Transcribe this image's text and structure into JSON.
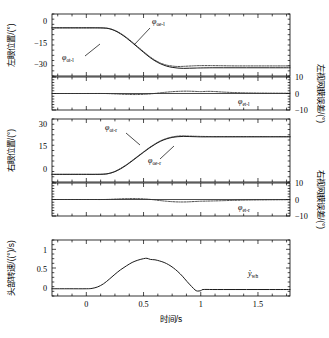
{
  "figure": {
    "xlabel": "时间/s",
    "x_ticklabels": [
      "0",
      "0.5",
      "1",
      "1.5"
    ],
    "x_tickvalues": [
      0,
      0.5,
      1,
      1.5
    ],
    "xlim": [
      -0.3,
      1.78
    ]
  },
  "panels": {
    "left_eye_position": {
      "ylabel": "左眼位置/(°)",
      "yticklabels": [
        "0",
        "-15",
        "-30"
      ],
      "ytickvalues": [
        0,
        -15,
        -30
      ],
      "ylim": [
        -38,
        5
      ],
      "annotations": [
        {
          "name": "phi-oe-l",
          "symbol": "φ",
          "subscript": "oe-l"
        },
        {
          "name": "phi-ot-l",
          "symbol": "φ",
          "subscript": "ot-l"
        }
      ]
    },
    "left_retinal_error": {
      "ylabel": "左视网膜误差/(°)",
      "yticklabels": [
        "10",
        "0",
        "-10"
      ],
      "ytickvalues": [
        10,
        0,
        -10
      ],
      "ylim": [
        -10,
        10
      ],
      "annotations": [
        {
          "name": "phi-et-l",
          "symbol": "φ",
          "subscript": "et-l"
        }
      ]
    },
    "right_eye_position": {
      "ylabel": "右眼位置/(°)",
      "yticklabels": [
        "30",
        "15",
        "0"
      ],
      "ytickvalues": [
        30,
        15,
        0
      ],
      "ylim": [
        -9,
        33
      ],
      "annotations": [
        {
          "name": "phi-ot-r",
          "symbol": "φ",
          "subscript": "ot-r"
        },
        {
          "name": "phi-oe-r",
          "symbol": "φ",
          "subscript": "oe-r"
        }
      ]
    },
    "right_retinal_error": {
      "ylabel": "右视网膜误差/(°)",
      "yticklabels": [
        "10",
        "0",
        "-10"
      ],
      "ytickvalues": [
        10,
        0,
        -10
      ],
      "ylim": [
        -10,
        10
      ],
      "annotations": [
        {
          "name": "phi-et-r",
          "symbol": "φ",
          "subscript": "et-r"
        }
      ]
    },
    "head_velocity": {
      "ylabel": "头部转速/((°)/s)",
      "yticklabels": [
        "1",
        "0.5",
        "0"
      ],
      "ytickvalues": [
        1,
        0.5,
        0
      ],
      "ylim": [
        -0.22,
        1.25
      ],
      "annotations": [
        {
          "name": "ydot-wh",
          "symbol": "ỳ",
          "subscript": "wh"
        }
      ]
    }
  },
  "chart_data": {
    "type": "line",
    "title": "",
    "xlabel": "时间/s",
    "xlim": [
      -0.3,
      1.78
    ],
    "grid": false,
    "legend": "none",
    "subplots": [
      {
        "name": "left_eye_position",
        "ylabel": "左眼位置/(°)",
        "ylim": [
          -38,
          5
        ],
        "yticks": [
          0,
          -15,
          -30
        ],
        "series": [
          {
            "name": "φ_ot-l",
            "style": "solid",
            "x": [
              -0.3,
              -0.1,
              0.0,
              0.08,
              0.15,
              0.2,
              0.25,
              0.3,
              0.35,
              0.4,
              0.45,
              0.5,
              0.55,
              0.6,
              0.65,
              0.7,
              0.75,
              0.8,
              0.85,
              0.9,
              0.95,
              1.0,
              1.1,
              1.2,
              1.3,
              1.4,
              1.5,
              1.6,
              1.7,
              1.78
            ],
            "y": [
              -4.6,
              -4.6,
              -4.6,
              -4.6,
              -4.7,
              -5.2,
              -6.6,
              -8.8,
              -11.6,
              -14.8,
              -18.2,
              -21.6,
              -24.8,
              -27.5,
              -29.6,
              -31.1,
              -32.0,
              -32.5,
              -32.7,
              -32.6,
              -32.5,
              -32.4,
              -32.3,
              -32.3,
              -32.3,
              -32.3,
              -32.3,
              -32.3,
              -32.3,
              -32.3
            ]
          },
          {
            "name": "φ_oe-l",
            "style": "dashed",
            "x": [
              -0.3,
              -0.1,
              0.0,
              0.08,
              0.15,
              0.2,
              0.25,
              0.3,
              0.35,
              0.4,
              0.45,
              0.5,
              0.55,
              0.6,
              0.65,
              0.7,
              0.75,
              0.8,
              0.85,
              0.9,
              0.95,
              1.0,
              1.1,
              1.2,
              1.3,
              1.4,
              1.5,
              1.6,
              1.7,
              1.78
            ],
            "y": [
              -4.6,
              -4.6,
              -4.6,
              -4.6,
              -4.7,
              -5.1,
              -6.4,
              -8.5,
              -11.2,
              -14.4,
              -17.8,
              -21.1,
              -24.3,
              -27.0,
              -29.1,
              -30.4,
              -31.1,
              -31.4,
              -31.3,
              -31.1,
              -30.9,
              -30.8,
              -30.8,
              -30.9,
              -31.0,
              -31.0,
              -31.0,
              -31.0,
              -31.0,
              -31.0
            ]
          }
        ]
      },
      {
        "name": "left_retinal_error",
        "ylabel": "左视网膜误差/(°)",
        "ylim": [
          -10,
          10
        ],
        "yticks": [
          10,
          0,
          -10
        ],
        "series": [
          {
            "name": "φ_et-l",
            "style": "dashed",
            "x": [
              -0.3,
              0.0,
              0.15,
              0.22,
              0.3,
              0.38,
              0.45,
              0.52,
              0.58,
              0.64,
              0.7,
              0.76,
              0.82,
              0.88,
              0.94,
              1.0,
              1.06,
              1.12,
              1.2,
              1.3,
              1.4,
              1.5,
              1.6,
              1.7,
              1.78
            ],
            "y": [
              0.0,
              0.0,
              0.0,
              -0.15,
              -0.4,
              -0.6,
              -0.62,
              -0.45,
              -0.1,
              0.35,
              0.8,
              1.15,
              1.35,
              1.42,
              1.3,
              1.15,
              1.3,
              1.2,
              0.85,
              0.55,
              0.38,
              0.28,
              0.22,
              0.18,
              0.16
            ]
          }
        ]
      },
      {
        "name": "right_eye_position",
        "ylabel": "右眼位置/(°)",
        "ylim": [
          -9,
          33
        ],
        "yticks": [
          30,
          15,
          0
        ],
        "series": [
          {
            "name": "φ_ot-r",
            "style": "solid",
            "x": [
              -0.3,
              -0.1,
              0.0,
              0.08,
              0.15,
              0.2,
              0.25,
              0.3,
              0.35,
              0.4,
              0.45,
              0.5,
              0.55,
              0.6,
              0.65,
              0.7,
              0.75,
              0.8,
              0.85,
              0.9,
              0.95,
              1.0,
              1.1,
              1.2,
              1.3,
              1.4,
              1.5,
              1.6,
              1.7,
              1.78
            ],
            "y": [
              -3.9,
              -3.9,
              -3.9,
              -3.9,
              -3.8,
              -3.3,
              -2.1,
              -0.2,
              2.2,
              5.0,
              7.9,
              10.8,
              13.6,
              16.1,
              18.2,
              19.7,
              20.7,
              21.2,
              21.4,
              21.3,
              21.2,
              21.1,
              21.1,
              21.1,
              21.1,
              21.1,
              21.1,
              21.1,
              21.1,
              21.1
            ]
          },
          {
            "name": "φ_oe-r",
            "style": "dashed",
            "x": [
              -0.3,
              -0.1,
              0.0,
              0.08,
              0.15,
              0.2,
              0.25,
              0.3,
              0.35,
              0.4,
              0.45,
              0.5,
              0.55,
              0.6,
              0.65,
              0.7,
              0.75,
              0.8,
              0.85,
              0.9,
              0.95,
              1.0,
              1.1,
              1.2,
              1.3,
              1.4,
              1.5,
              1.6,
              1.7,
              1.78
            ],
            "y": [
              -3.9,
              -3.9,
              -3.9,
              -3.9,
              -3.8,
              -3.2,
              -1.9,
              0.1,
              2.5,
              5.3,
              8.2,
              11.1,
              13.9,
              16.4,
              18.5,
              20.0,
              21.0,
              21.6,
              21.7,
              21.6,
              21.5,
              21.4,
              21.3,
              21.3,
              21.3,
              21.3,
              21.3,
              21.3,
              21.3,
              21.3
            ]
          }
        ]
      },
      {
        "name": "right_retinal_error",
        "ylabel": "右视网膜误差/(°)",
        "ylim": [
          -10,
          10
        ],
        "yticks": [
          10,
          0,
          -10
        ],
        "series": [
          {
            "name": "φ_et-r",
            "style": "dashed",
            "x": [
              -0.3,
              0.0,
              0.15,
              0.22,
              0.3,
              0.38,
              0.45,
              0.52,
              0.58,
              0.64,
              0.7,
              0.76,
              0.82,
              0.88,
              0.94,
              1.0,
              1.06,
              1.12,
              1.2,
              1.3,
              1.4,
              1.5,
              1.6,
              1.7,
              1.78
            ],
            "y": [
              0.0,
              0.0,
              0.0,
              0.15,
              0.4,
              0.55,
              0.52,
              0.3,
              -0.1,
              -0.6,
              -1.05,
              -1.35,
              -1.5,
              -1.45,
              -1.25,
              -1.05,
              -0.95,
              -0.85,
              -0.7,
              -0.5,
              -0.35,
              -0.26,
              -0.2,
              -0.16,
              -0.14
            ]
          }
        ]
      },
      {
        "name": "head_velocity",
        "ylabel": "头部转速/((°)/s)",
        "ylim": [
          -0.22,
          1.25
        ],
        "yticks": [
          1,
          0.5,
          0
        ],
        "series": [
          {
            "name": "ỳ_wh",
            "style": "solid",
            "x": [
              -0.3,
              -0.15,
              0.0,
              0.05,
              0.1,
              0.15,
              0.2,
              0.25,
              0.3,
              0.35,
              0.4,
              0.45,
              0.5,
              0.53,
              0.56,
              0.6,
              0.64,
              0.68,
              0.72,
              0.76,
              0.8,
              0.84,
              0.88,
              0.92,
              0.95,
              0.97,
              1.0,
              1.02,
              1.1,
              1.2,
              1.3,
              1.4,
              1.5,
              1.6,
              1.7,
              1.78
            ],
            "y": [
              -0.03,
              -0.03,
              -0.03,
              -0.02,
              0.02,
              0.1,
              0.22,
              0.35,
              0.47,
              0.57,
              0.66,
              0.72,
              0.76,
              0.77,
              0.74,
              0.73,
              0.7,
              0.66,
              0.6,
              0.52,
              0.42,
              0.3,
              0.16,
              0.03,
              -0.06,
              -0.09,
              -0.08,
              -0.05,
              -0.05,
              -0.05,
              -0.05,
              -0.05,
              -0.05,
              -0.05,
              -0.05,
              -0.05
            ]
          }
        ]
      }
    ]
  }
}
